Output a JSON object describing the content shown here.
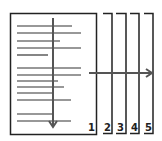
{
  "diagram": {
    "colors": {
      "stroke": "#222222",
      "text_line": "#333333",
      "arrow": "#555555",
      "background": "#ffffff"
    },
    "main_page": {
      "label": "1",
      "text_lines": [
        {
          "y": 26,
          "x2": 72
        },
        {
          "y": 33,
          "x2": 81
        },
        {
          "y": 41,
          "x2": 60
        },
        {
          "y": 48,
          "x2": 81
        },
        {
          "y": 55,
          "x2": 48
        },
        {
          "y": 68,
          "x2": 81
        },
        {
          "y": 75,
          "x2": 81
        },
        {
          "y": 81,
          "x2": 58
        },
        {
          "y": 87,
          "x2": 64
        },
        {
          "y": 93,
          "x2": 54
        },
        {
          "y": 100,
          "x2": 71
        },
        {
          "y": 114,
          "x2": 54
        },
        {
          "y": 121,
          "x2": 71
        }
      ]
    },
    "stacked_pages": [
      {
        "label": "2"
      },
      {
        "label": "3"
      },
      {
        "label": "4"
      },
      {
        "label": "5"
      }
    ],
    "arrows": [
      {
        "name": "vertical-reading-arrow",
        "direction": "down"
      },
      {
        "name": "horizontal-page-arrow",
        "direction": "right"
      }
    ]
  }
}
